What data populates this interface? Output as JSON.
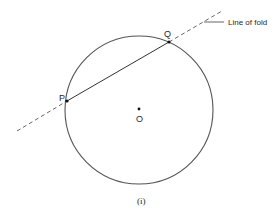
{
  "figure": {
    "caption": "(i)",
    "fold_label": "Line of fold",
    "points": {
      "P": "P",
      "Q": "Q",
      "O": "O"
    },
    "colors": {
      "stroke": "#555555",
      "text": "#2a2a2a",
      "background": "#ffffff"
    }
  }
}
